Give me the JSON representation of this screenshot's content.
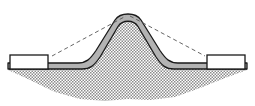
{
  "figure": {
    "type": "technical-cross-section-diagram",
    "canvas": {
      "width": 255,
      "height": 106,
      "background": "#ffffff"
    },
    "colors": {
      "outline": "#1a1a1a",
      "sheet_fill": "#b3b3b3",
      "block_fill": "#ffffff",
      "block_stroke": "#1a1a1a",
      "hatch_dark": "#8c8c8c",
      "hatch_light": "#ffffff",
      "dashed_guide": "#555555"
    },
    "elements": {
      "left_block": {
        "label": "left clamping die block",
        "x": 10,
        "y": 55,
        "width": 38,
        "height": 14
      },
      "right_block": {
        "label": "right clamping die block",
        "x": 207,
        "y": 55,
        "width": 38,
        "height": 14
      },
      "sheet": {
        "label": "formed sheet metal profile",
        "apex_x": 128,
        "apex_y": 13,
        "base_y": 69,
        "thickness": 6,
        "left_flange_x": 46,
        "right_flange_x": 210
      },
      "hatched_region": {
        "label": "hatched material / workpiece region",
        "top_y": 69,
        "bottom_y": 101,
        "left_x": 8,
        "right_x": 247
      },
      "dashed_guides": {
        "label": "dashed reference profile lines",
        "left": {
          "x1": 52,
          "y1": 56,
          "x2": 126,
          "y2": 16
        },
        "right": {
          "x1": 130,
          "y1": 16,
          "x2": 205,
          "y2": 56
        }
      }
    }
  },
  "chart_data": {
    "type": "line",
    "xlabel": "",
    "ylabel": "",
    "xlim": [
      0,
      255
    ],
    "ylim": [
      106,
      0
    ],
    "grid": false,
    "legend": "none",
    "series": [
      {
        "name": "formed sheet outer profile",
        "x": [
          46,
          78,
          88,
          98,
          112,
          121,
          128,
          135,
          144,
          158,
          168,
          178,
          210
        ],
        "y": [
          63,
          63,
          61,
          52,
          28,
          17,
          13,
          17,
          28,
          52,
          61,
          63,
          63
        ]
      },
      {
        "name": "formed sheet inner profile",
        "x": [
          46,
          82,
          92,
          101,
          114,
          123,
          128,
          133,
          142,
          155,
          164,
          174,
          210
        ],
        "y": [
          69,
          69,
          67,
          58,
          34,
          23,
          19,
          23,
          34,
          58,
          67,
          69,
          69
        ]
      },
      {
        "name": "dashed reference profile",
        "x": [
          52,
          126,
          130,
          205
        ],
        "y": [
          56,
          16,
          16,
          56
        ]
      },
      {
        "name": "hatched region lower boundary",
        "x": [
          8,
          30,
          55,
          80,
          105,
          128,
          150,
          175,
          200,
          225,
          247
        ],
        "y": [
          70,
          80,
          92,
          99,
          101,
          99,
          100,
          97,
          88,
          78,
          70
        ]
      }
    ]
  }
}
